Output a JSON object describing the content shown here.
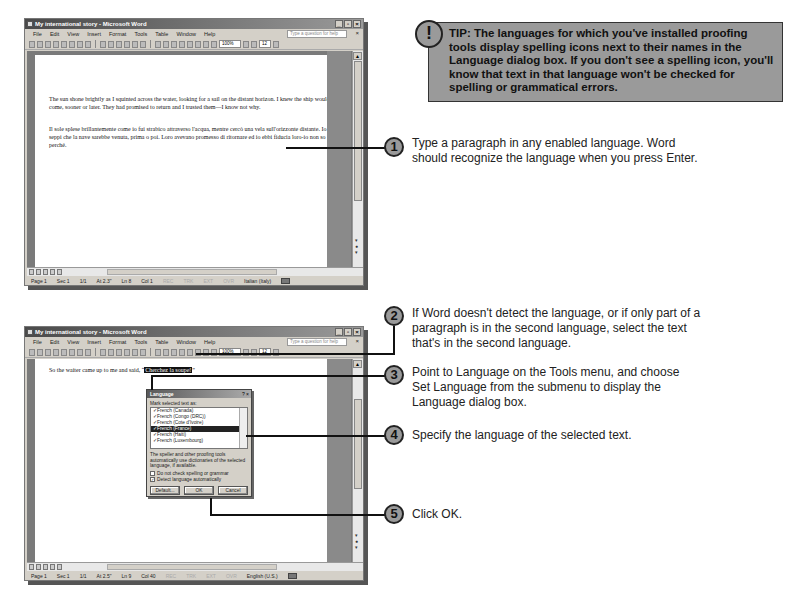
{
  "window1": {
    "title": "My international story - Microsoft Word",
    "menus": [
      "File",
      "Edit",
      "View",
      "Insert",
      "Format",
      "Tools",
      "Table",
      "Window",
      "Help"
    ],
    "ask_placeholder": "Type a question for help",
    "zoom": "100%",
    "font_size": "12",
    "paragraph_english": "The sun shone brightly as I squinted across the water, looking for a sail on the distant horizon. I knew the ship would come, sooner or later. They had promised to return and I trusted them—I know not why.",
    "paragraph_italian": "Il sole splese brillantemente come io fui strabico attraverso l'acqua, mentre cercò una vela sull'orizzonte distante. Io seppi che la nave sarebbe venuta, prima o poi. Loro avevano promesso di ritornare ed io ebbi fiducia loro-io non so perché.",
    "status": {
      "page": "Page 1",
      "sec": "Sec 1",
      "pages": "1/1",
      "at": "At 2.3\"",
      "ln": "Ln 8",
      "col": "Col 1",
      "rec": "REC",
      "trk": "TRK",
      "ext": "EXT",
      "ovr": "OVR",
      "language": "Italian (Italy)"
    }
  },
  "window2": {
    "title": "My international story - Microsoft Word",
    "menus": [
      "File",
      "Edit",
      "View",
      "Insert",
      "Format",
      "Tools",
      "Table",
      "Window",
      "Help"
    ],
    "ask_placeholder": "Type a question for help",
    "zoom": "100%",
    "font_size": "12",
    "line_prefix": "So the waiter came up to me and said, “",
    "selected_text": "Cherchez la soupe!",
    "line_suffix": "”",
    "status": {
      "page": "Page 1",
      "sec": "Sec 1",
      "pages": "1/1",
      "at": "At 2.5\"",
      "ln": "Ln 9",
      "col": "Col 40",
      "rec": "REC",
      "trk": "TRK",
      "ext": "EXT",
      "ovr": "OVR",
      "language": "English (U.S.)"
    }
  },
  "dialog": {
    "title": "Language",
    "help_btn": "?",
    "close_btn": "×",
    "label": "Mark selected text as:",
    "items": [
      {
        "label": "French (Canada)",
        "selected": false
      },
      {
        "label": "French (Congo (DRC))",
        "selected": false
      },
      {
        "label": "French (Cote d'Ivoire)",
        "selected": false
      },
      {
        "label": "French (France)",
        "selected": true
      },
      {
        "label": "French (Haiti)",
        "selected": false
      },
      {
        "label": "French (Luxembourg)",
        "selected": false
      }
    ],
    "note": "The speller and other proofing tools automatically use dictionaries of the selected language, if available.",
    "check_no_spelling": "Do not check spelling or grammar",
    "check_detect": "Detect language automatically",
    "default_btn": "Default...",
    "ok_btn": "OK",
    "cancel_btn": "Cancel"
  },
  "tip": {
    "icon": "!",
    "text": "TIP: The languages for which you've installed proofing tools display spelling icons next to their names in the Language dialog box. If you don't see a spelling icon, you'll know that text in that language won't be checked for spelling or grammatical errors."
  },
  "steps": [
    {
      "num": "1",
      "text": "Type a paragraph in any enabled language. Word should recognize the language when you press Enter."
    },
    {
      "num": "2",
      "text": "If Word doesn't detect the language, or if only part of a paragraph is in the second language, select the text that's in the second language."
    },
    {
      "num": "3",
      "text": "Point to Language on the Tools menu, and choose Set Language from the submenu to display the Language dialog box."
    },
    {
      "num": "4",
      "text": "Specify the language of the selected text."
    },
    {
      "num": "5",
      "text": "Click OK."
    }
  ]
}
